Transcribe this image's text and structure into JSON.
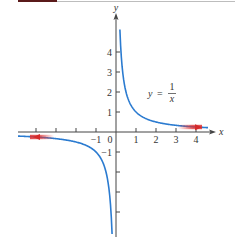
{
  "chart_data": {
    "type": "line",
    "title": "",
    "function_label": {
      "lhs": "y",
      "eq": "=",
      "numerator": "1",
      "denominator": "x"
    },
    "xlabel": "x",
    "ylabel": "y",
    "xlim": [
      -4.9,
      4.8
    ],
    "ylim": [
      -5.2,
      5.9
    ],
    "x_ticks": [
      -4,
      -3,
      -2,
      -1,
      1,
      2,
      3,
      4
    ],
    "x_tick_labels": {
      "-1": "−1",
      "0": "0",
      "1": "1",
      "2": "2",
      "3": "3",
      "4": "4"
    },
    "y_ticks": [
      -4,
      -3,
      -2,
      -1,
      1,
      2,
      3,
      4
    ],
    "y_tick_labels": {
      "1": "1",
      "2": "2",
      "3": "3",
      "4": "4",
      "-1": "−1"
    },
    "series": [
      {
        "name": "y = 1/x (x>0)",
        "color": "#2b7bd0",
        "x": [
          0.18,
          0.25,
          0.33,
          0.5,
          0.75,
          1,
          1.5,
          2,
          3,
          4,
          4.5
        ],
        "y": [
          5.5,
          4,
          3,
          2,
          1.33,
          1,
          0.67,
          0.5,
          0.33,
          0.25,
          0.22
        ]
      },
      {
        "name": "y = 1/x (x<0)",
        "color": "#2b7bd0",
        "x": [
          -4.9,
          -4,
          -3,
          -2,
          -1.5,
          -1,
          -0.75,
          -0.5,
          -0.33,
          -0.25,
          -0.2
        ],
        "y": [
          -0.2,
          -0.25,
          -0.33,
          -0.5,
          -0.67,
          -1,
          -1.33,
          -2,
          -3,
          -4,
          -5
        ]
      }
    ],
    "annotations": [
      {
        "type": "arrow",
        "color": "#e03030",
        "at_x": 4,
        "direction": "right",
        "meaning": "approaches 0 as x → ∞"
      },
      {
        "type": "arrow",
        "color": "#e03030",
        "at_x": -4,
        "direction": "left",
        "meaning": "approaches 0 as x → −∞"
      }
    ],
    "grid": false,
    "legend": null
  }
}
